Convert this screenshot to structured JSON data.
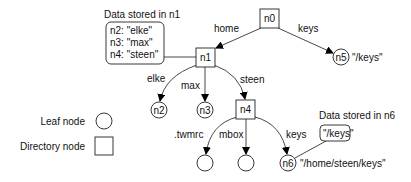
{
  "diagram": {
    "type": "naming-graph",
    "nodes": {
      "n0": {
        "label": "n0",
        "kind": "directory"
      },
      "n1": {
        "label": "n1",
        "kind": "directory"
      },
      "n2": {
        "label": "n2",
        "kind": "leaf"
      },
      "n3": {
        "label": "n3",
        "kind": "leaf"
      },
      "n4": {
        "label": "n4",
        "kind": "directory"
      },
      "n5": {
        "label": "n5",
        "kind": "leaf",
        "annotation": "\"/keys\""
      },
      "n6": {
        "label": "n6",
        "kind": "leaf",
        "annotation": "\"/home/steen/keys\""
      },
      "twmrc": {
        "label": "",
        "kind": "leaf"
      },
      "mbox": {
        "label": "",
        "kind": "leaf"
      }
    },
    "edges": {
      "home": "home",
      "keys_top": "keys",
      "elke": "elke",
      "max": "max",
      "steen": "steen",
      "twmrc": ".twmrc",
      "mbox": "mbox",
      "keys_bottom": "keys"
    },
    "data_n1": {
      "title": "Data stored in n1",
      "lines": [
        "n2: \"elke\"",
        "n3: \"max\"",
        "n4: \"steen\""
      ]
    },
    "data_n6": {
      "title": "Data stored in n6",
      "lines": [
        "\"/keys\""
      ]
    },
    "legend": {
      "leaf": "Leaf node",
      "directory": "Directory node"
    }
  }
}
